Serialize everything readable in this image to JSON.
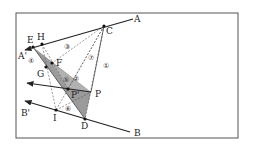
{
  "diagram": {
    "frame": {
      "x": 16,
      "y": 13,
      "width": 222,
      "height": 125,
      "stroke": "#555555"
    },
    "colors": {
      "line": "#222222",
      "dashed": "#555555",
      "shade": "#8a8a8a",
      "shade_light": "#c4c4c4"
    },
    "points": {
      "A": {
        "label": "A",
        "x": 133,
        "y": 19,
        "lx": 134,
        "ly": 22
      },
      "A_prime": {
        "label": "A'",
        "x": 25,
        "y": 50,
        "lx": 18,
        "ly": 59
      },
      "C": {
        "label": "C",
        "x": 104,
        "y": 26,
        "lx": 106,
        "ly": 34
      },
      "H": {
        "label": "H",
        "x": 42,
        "y": 44,
        "lx": 37,
        "ly": 40
      },
      "E": {
        "label": "E",
        "x": 33,
        "y": 47,
        "lx": 27,
        "ly": 43
      },
      "F": {
        "label": "F",
        "x": 52,
        "y": 63,
        "lx": 56,
        "ly": 66
      },
      "G": {
        "label": "G",
        "x": 46,
        "y": 67,
        "lx": 37,
        "ly": 77
      },
      "P": {
        "label": "P",
        "x": 91,
        "y": 92,
        "lx": 95,
        "ly": 97
      },
      "P_prime": {
        "label": "P'",
        "x": 68,
        "y": 89,
        "lx": 71,
        "ly": 98
      },
      "I": {
        "label": "I",
        "x": 56,
        "y": 110,
        "lx": 53,
        "ly": 121
      },
      "D": {
        "label": "D",
        "x": 85,
        "y": 119,
        "lx": 81,
        "ly": 129
      },
      "B": {
        "label": "B",
        "x": 130,
        "y": 132,
        "lx": 134,
        "ly": 136
      },
      "B_prime": {
        "label": "B'",
        "x": 25,
        "y": 101,
        "lx": 21,
        "ly": 116
      }
    },
    "region_labels": [
      {
        "label": "①",
        "x": 106,
        "y": 66
      },
      {
        "label": "②",
        "x": 76,
        "y": 79
      },
      {
        "label": "③",
        "x": 67,
        "y": 47
      },
      {
        "label": "④",
        "x": 31,
        "y": 61
      },
      {
        "label": "⑤",
        "x": 66,
        "y": 80
      },
      {
        "label": "⑥",
        "x": 68,
        "y": 109
      },
      {
        "label": "⑦",
        "x": 91,
        "y": 58
      }
    ]
  }
}
